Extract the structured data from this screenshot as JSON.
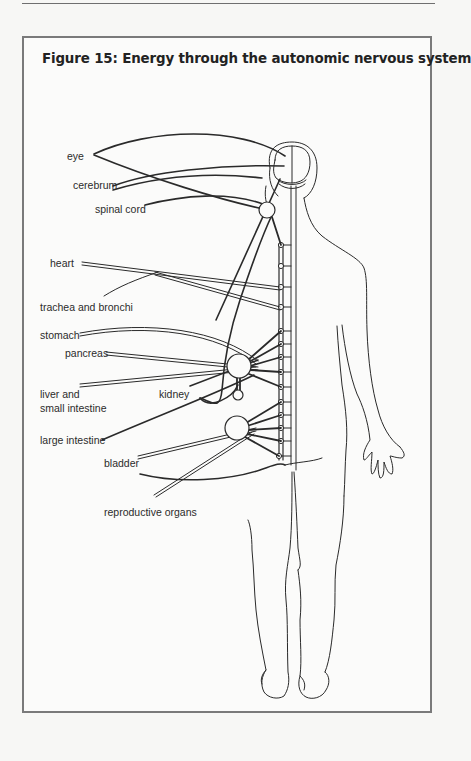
{
  "figure": {
    "title": "Figure 15: Energy through the autonomic nervous system",
    "number": 15
  },
  "diagram": {
    "labels": [
      {
        "id": "eye",
        "text": "eye"
      },
      {
        "id": "cerebrum",
        "text": "cerebrum"
      },
      {
        "id": "spinal-cord",
        "text": "spinal cord"
      },
      {
        "id": "heart",
        "text": "heart"
      },
      {
        "id": "trachea",
        "text": "trachea and bronchi"
      },
      {
        "id": "stomach",
        "text": "stomach"
      },
      {
        "id": "pancreas",
        "text": "pancreas"
      },
      {
        "id": "liver-1",
        "text": "liver and"
      },
      {
        "id": "liver-2",
        "text": "small intestine"
      },
      {
        "id": "kidney",
        "text": "kidney"
      },
      {
        "id": "large-intestine",
        "text": "large intestine"
      },
      {
        "id": "bladder",
        "text": "bladder"
      },
      {
        "id": "reproductive",
        "text": "reproductive organs"
      }
    ],
    "colors": {
      "line": "#2a2a2a",
      "border": "#7a7a7a",
      "background": "#fbfbfa"
    }
  }
}
